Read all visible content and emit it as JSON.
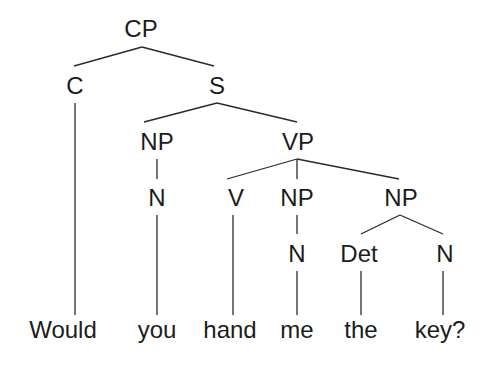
{
  "diagram": {
    "type": "syntax-tree",
    "sentence": "Would you hand me the key?",
    "colors": {
      "line": "#2a2a2a",
      "text": "#1c1c1c",
      "background": "#ffffff"
    },
    "nodes": {
      "cp": "CP",
      "c": "C",
      "s": "S",
      "np_subj": "NP",
      "vp": "VP",
      "n_subj": "N",
      "v": "V",
      "np_obj1": "NP",
      "np_obj2": "NP",
      "n_obj1": "N",
      "det": "Det",
      "n_obj2": "N"
    },
    "leaves": [
      "Would",
      "you",
      "hand",
      "me",
      "the",
      "key?"
    ],
    "structure": {
      "CP": [
        "C",
        "S"
      ],
      "C": [
        "Would"
      ],
      "S": [
        "NP",
        "VP"
      ],
      "NP(subj)": [
        "N"
      ],
      "N(subj)": [
        "you"
      ],
      "VP": [
        "V",
        "NP",
        "NP"
      ],
      "V": [
        "hand"
      ],
      "NP(obj1)": [
        "N"
      ],
      "N(obj1)": [
        "me"
      ],
      "NP(obj2)": [
        "Det",
        "N"
      ],
      "Det": [
        "the"
      ],
      "N(obj2)": [
        "key?"
      ]
    }
  }
}
